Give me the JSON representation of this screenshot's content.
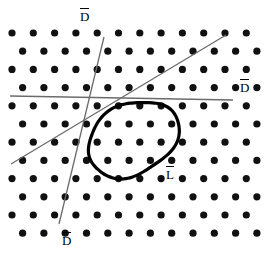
{
  "figure": {
    "type": "diagram",
    "width": 264,
    "height": 254,
    "background_color": "#ffffff",
    "dot_color": "#111111",
    "line_color": "#6b6b6b",
    "loop_color": "#000000",
    "text_color": "#000000"
  },
  "labels": {
    "d_top": {
      "glyph": "D",
      "overbar": true,
      "name": "label-d-top"
    },
    "d_right": {
      "glyph": "D",
      "overbar": true,
      "name": "label-d-right"
    },
    "d_bottom": {
      "glyph": "D",
      "overbar": true,
      "name": "label-d-bottom"
    },
    "l_loop": {
      "glyph": "L",
      "overbar": true,
      "name": "label-l-loop"
    }
  },
  "lattice": {
    "dot_radius": 3.6,
    "row_spacing": 18.2,
    "col_spacing": 21.3,
    "row_offset": 10.6,
    "origin_x": 12,
    "origin_y": 33,
    "rows": 12,
    "cols": 13
  },
  "lines": [
    {
      "name": "line-d-horizontal",
      "label": "D",
      "x1": 10,
      "y1": 96,
      "x2": 233,
      "y2": 100,
      "width": 1.6
    },
    {
      "name": "line-d-steep",
      "label": "D",
      "x1": 104,
      "y1": 37,
      "x2": 59,
      "y2": 224,
      "width": 1.3
    },
    {
      "name": "line-d-diagonal",
      "label": "D",
      "x1": 226,
      "y1": 35,
      "x2": 11,
      "y2": 164,
      "width": 1.3
    }
  ],
  "loop": {
    "name": "loop-l",
    "label": "L",
    "center_x": 133,
    "center_y": 139,
    "radius_x": 48,
    "radius_y": 35,
    "rotation_deg": -28,
    "stroke_width": 3.2
  }
}
